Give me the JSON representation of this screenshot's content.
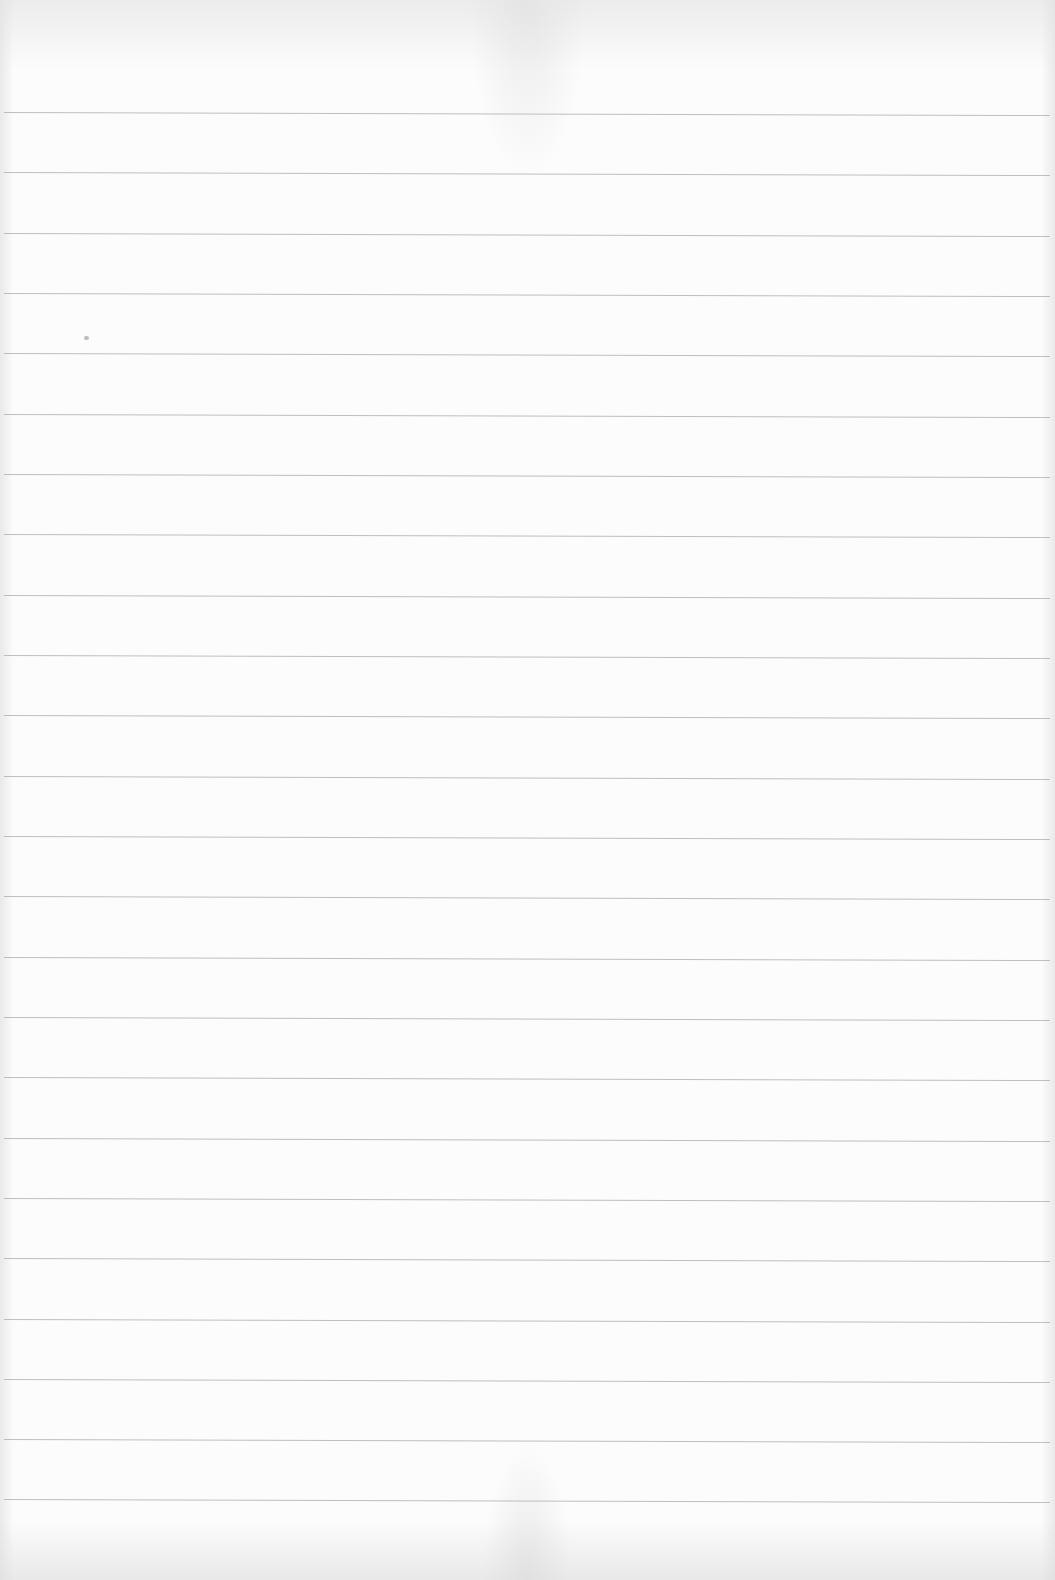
{
  "document": {
    "type": "blank ruled paper",
    "text_content": "",
    "ruled_lines": {
      "count": 24,
      "color": "#b4b4b4",
      "background": "#fcfcfc",
      "positions_y": [
        113,
        173,
        234,
        294,
        354,
        415,
        475,
        535,
        596,
        656,
        716,
        777,
        837,
        897,
        958,
        1018,
        1078,
        1139,
        1199,
        1259,
        1320,
        1380,
        1440,
        1500
      ]
    },
    "marks": [
      {
        "name": "speck",
        "x": 84,
        "y": 336
      }
    ]
  }
}
